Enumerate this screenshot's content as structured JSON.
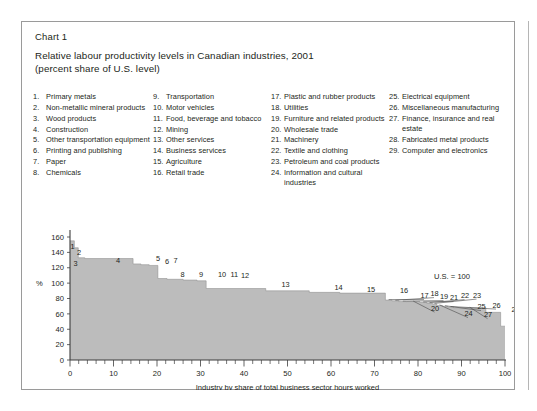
{
  "figure": {
    "number_label": "Chart 1",
    "title": "Relative labour productivity levels in Canadian industries, 2001\n(percent share of U.S. level)"
  },
  "legend": {
    "columns": [
      {
        "entries": [
          {
            "num": "1.",
            "text": "Primary metals"
          },
          {
            "num": "2.",
            "text": "Non-metallic mineral products"
          },
          {
            "num": "3.",
            "text": "Wood products"
          },
          {
            "num": "4.",
            "text": "Construction"
          },
          {
            "num": "5.",
            "text": "Other transportation equipment"
          },
          {
            "num": "6.",
            "text": "Printing and publishing"
          },
          {
            "num": "7.",
            "text": "Paper"
          },
          {
            "num": "8.",
            "text": "Chemicals"
          }
        ]
      },
      {
        "entries": [
          {
            "num": "9.",
            "text": "Transportation"
          },
          {
            "num": "10.",
            "text": "Motor vehicles"
          },
          {
            "num": "11.",
            "text": "Food, beverage and tobacco"
          },
          {
            "num": "12.",
            "text": "Mining"
          },
          {
            "num": "13.",
            "text": "Other services"
          },
          {
            "num": "14.",
            "text": "Business services"
          },
          {
            "num": "15.",
            "text": "Agriculture"
          },
          {
            "num": "16.",
            "text": "Retail trade"
          }
        ]
      },
      {
        "entries": [
          {
            "num": "17.",
            "text": "Plastic and rubber products"
          },
          {
            "num": "18.",
            "text": "Utilities"
          },
          {
            "num": "19.",
            "text": "Furniture and related products"
          },
          {
            "num": "20.",
            "text": "Wholesale trade"
          },
          {
            "num": "21.",
            "text": "Machinery"
          },
          {
            "num": "22.",
            "text": "Textile and clothing"
          },
          {
            "num": "23.",
            "text": "Petroleum and coal products"
          },
          {
            "num": "24.",
            "text": "Information and cultural industries"
          }
        ]
      },
      {
        "entries": [
          {
            "num": "25.",
            "text": "Electrical equipment"
          },
          {
            "num": "26.",
            "text": "Miscellaneous manufacturing"
          },
          {
            "num": "27.",
            "text": "Finance, insurance and real estate"
          },
          {
            "num": "28.",
            "text": "Fabricated metal products"
          },
          {
            "num": "29.",
            "text": "Computer and electronics"
          }
        ]
      }
    ]
  },
  "chart_data": {
    "type": "area",
    "title": "Relative labour productivity levels in Canadian industries, 2001 (percent share of U.S. level)",
    "xlabel": "Industry by share of total business sector hours worked",
    "ylabel": "%",
    "xlim": [
      0,
      100
    ],
    "ylim": [
      0,
      160
    ],
    "x_ticks": [
      0,
      10,
      20,
      30,
      40,
      50,
      60,
      70,
      80,
      90,
      100
    ],
    "x_minor_tick_step": 2,
    "y_ticks": [
      0,
      20,
      40,
      60,
      80,
      100,
      120,
      140,
      160
    ],
    "grid": false,
    "legend_position": "above-plot-numbered-list",
    "annotation": "U.S. = 100",
    "reference_level": 100,
    "fill_color": "#bcbcbc",
    "note": "Step (staircase) area chart: each industry occupies a horizontal span equal to its share of total business sector hours worked; height is its labour productivity as a percent of the U.S. level.",
    "steps": [
      {
        "id": 1,
        "industry": "Primary metals",
        "x_start": 0.0,
        "x_end": 1.0,
        "value": 155
      },
      {
        "id": 2,
        "industry": "Non-metallic mineral products",
        "x_start": 1.0,
        "x_end": 1.9,
        "value": 146
      },
      {
        "id": 3,
        "industry": "Wood products",
        "x_start": 1.9,
        "x_end": 3.4,
        "value": 133
      },
      {
        "id": 4,
        "industry": "Construction",
        "x_start": 3.4,
        "x_end": 14.5,
        "value": 132
      },
      {
        "id": 5,
        "industry": "Other transportation equipment",
        "x_start": 14.5,
        "x_end": 16.3,
        "value": 125
      },
      {
        "id": 6,
        "industry": "Printing and publishing",
        "x_start": 16.3,
        "x_end": 18.2,
        "value": 124
      },
      {
        "id": 7,
        "industry": "Paper",
        "x_start": 18.2,
        "x_end": 20.2,
        "value": 123
      },
      {
        "id": 8,
        "industry": "Chemicals",
        "x_start": 20.2,
        "x_end": 22.3,
        "value": 106
      },
      {
        "id": 9,
        "industry": "Transportation",
        "x_start": 22.3,
        "x_end": 26.0,
        "value": 105
      },
      {
        "id": 10,
        "industry": "Motor vehicles",
        "x_start": 26.0,
        "x_end": 27.4,
        "value": 104
      },
      {
        "id": 11,
        "industry": "Food, beverage and tobacco",
        "x_start": 27.4,
        "x_end": 29.2,
        "value": 104
      },
      {
        "id": 12,
        "industry": "Mining",
        "x_start": 29.2,
        "x_end": 31.3,
        "value": 103
      },
      {
        "id": 13,
        "industry": "Other services",
        "x_start": 31.3,
        "x_end": 45.0,
        "value": 93
      },
      {
        "id": 14,
        "industry": "Business services",
        "x_start": 45.0,
        "x_end": 55.0,
        "value": 90
      },
      {
        "id": 15,
        "industry": "Agriculture",
        "x_start": 55.0,
        "x_end": 62.0,
        "value": 88
      },
      {
        "id": 16,
        "industry": "Retail trade",
        "x_start": 62.0,
        "x_end": 72.5,
        "value": 87
      },
      {
        "id": 17,
        "industry": "Plastic and rubber products",
        "x_start": 72.5,
        "x_end": 74.0,
        "value": 78
      },
      {
        "id": 18,
        "industry": "Utilities",
        "x_start": 74.0,
        "x_end": 75.6,
        "value": 77
      },
      {
        "id": 19,
        "industry": "Furniture and related products",
        "x_start": 75.6,
        "x_end": 77.4,
        "value": 76
      },
      {
        "id": 20,
        "industry": "Wholesale trade",
        "x_start": 77.4,
        "x_end": 80.4,
        "value": 76
      },
      {
        "id": 21,
        "industry": "Machinery",
        "x_start": 80.4,
        "x_end": 82.0,
        "value": 75
      },
      {
        "id": 22,
        "industry": "Textile and clothing",
        "x_start": 82.0,
        "x_end": 83.3,
        "value": 74
      },
      {
        "id": 23,
        "industry": "Petroleum and coal products",
        "x_start": 83.3,
        "x_end": 84.3,
        "value": 73
      },
      {
        "id": 24,
        "industry": "Information and cultural industries",
        "x_start": 84.3,
        "x_end": 85.6,
        "value": 71
      },
      {
        "id": 25,
        "industry": "Electrical equipment",
        "x_start": 85.6,
        "x_end": 86.8,
        "value": 70
      },
      {
        "id": 26,
        "industry": "Miscellaneous manufacturing",
        "x_start": 86.8,
        "x_end": 88.2,
        "value": 69
      },
      {
        "id": 27,
        "industry": "Finance, insurance and real estate",
        "x_start": 88.2,
        "x_end": 95.6,
        "value": 68
      },
      {
        "id": 28,
        "industry": "Fabricated metal products",
        "x_start": 95.6,
        "x_end": 99.0,
        "value": 62
      },
      {
        "id": 29,
        "industry": "Computer and electronics",
        "x_start": 99.0,
        "x_end": 100.0,
        "value": 44
      }
    ],
    "point_labels": [
      {
        "id": 1,
        "text": "1",
        "tx": 48.5,
        "ty": 226.5,
        "leader": null
      },
      {
        "id": 2,
        "text": "2",
        "tx": 55.0,
        "ty": 232.5,
        "leader": null
      },
      {
        "id": 3,
        "text": "3",
        "tx": 51.5,
        "ty": 243.5,
        "leader": null
      },
      {
        "id": 4,
        "text": "4",
        "tx": 94.0,
        "ty": 240.5,
        "leader": null
      },
      {
        "id": 5,
        "text": "5",
        "tx": 134.0,
        "ty": 238.5,
        "leader": null
      },
      {
        "id": 6,
        "text": "6",
        "tx": 143.0,
        "ty": 241.5,
        "leader": null
      },
      {
        "id": 7,
        "text": "7",
        "tx": 151.5,
        "ty": 241.0,
        "leader": null
      },
      {
        "id": 8,
        "text": "8",
        "tx": 158.5,
        "ty": 255.0,
        "leader": null
      },
      {
        "id": 9,
        "text": "9",
        "tx": 177.0,
        "ty": 255.0,
        "leader": null
      },
      {
        "id": 10,
        "text": "10",
        "tx": 196.0,
        "ty": 255.0,
        "leader": null
      },
      {
        "id": 11,
        "text": "11",
        "tx": 208.5,
        "ty": 255.0,
        "leader": null
      },
      {
        "id": 12,
        "text": "12",
        "tx": 219.0,
        "ty": 256.0,
        "leader": null
      },
      {
        "id": 13,
        "text": "13",
        "tx": 259.5,
        "ty": 264.5,
        "leader": null
      },
      {
        "id": 14,
        "text": "14",
        "tx": 312.5,
        "ty": 267.5,
        "leader": null
      },
      {
        "id": 15,
        "text": "15",
        "tx": 345.0,
        "ty": 269.5,
        "leader": null
      },
      {
        "id": 16,
        "text": "16",
        "tx": 378.0,
        "ty": 271.0,
        "leader": null
      },
      {
        "id": 17,
        "text": "17",
        "tx": 398.5,
        "ty": 276.0,
        "leader": "17"
      },
      {
        "id": 18,
        "text": "18",
        "tx": 408.5,
        "ty": 274.0,
        "leader": "18"
      },
      {
        "id": 19,
        "text": "19",
        "tx": 418.0,
        "ty": 277.0,
        "leader": "19"
      },
      {
        "id": 20,
        "text": "20",
        "tx": 409.0,
        "ty": 288.5,
        "leader": "20"
      },
      {
        "id": 21,
        "text": "21",
        "tx": 428.0,
        "ty": 278.0,
        "leader": "21"
      },
      {
        "id": 22,
        "text": "22",
        "tx": 439.0,
        "ty": 276.0,
        "leader": "22"
      },
      {
        "id": 23,
        "text": "23",
        "tx": 451.0,
        "ty": 275.5,
        "leader": "23"
      },
      {
        "id": 24,
        "text": "24",
        "tx": 442.5,
        "ty": 294.0,
        "leader": "24"
      },
      {
        "id": 25,
        "text": "25",
        "tx": 455.5,
        "ty": 287.0,
        "leader": "25"
      },
      {
        "id": 26,
        "text": "26",
        "tx": 470.5,
        "ty": 285.5,
        "leader": "26"
      },
      {
        "id": 27,
        "text": "27",
        "tx": 462.0,
        "ty": 295.0,
        "leader": "27"
      },
      {
        "id": 28,
        "text": "28",
        "tx": 489.5,
        "ty": 289.5,
        "leader": null
      },
      {
        "id": 29,
        "text": "29",
        "tx": 500.5,
        "ty": 294.5,
        "leader": null
      }
    ]
  }
}
